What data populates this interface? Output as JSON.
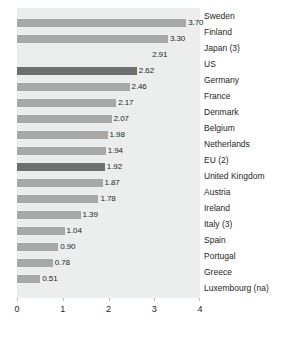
{
  "chart_data": {
    "type": "bar",
    "orientation": "horizontal",
    "title": "",
    "subtitle": "",
    "xlabel": "",
    "ylabel": "",
    "xlim": [
      0,
      4
    ],
    "xticks": [
      "0",
      "1",
      "2",
      "3",
      "4"
    ],
    "grid": false,
    "legend": "none",
    "categories": [
      "Sweden",
      "Finland",
      "Japan (3)",
      "US",
      "Germany",
      "France",
      "Denmark",
      "Belgium",
      "Netherlands",
      "EU (2)",
      "United Kingdom",
      "Austria",
      "Ireland",
      "Italy (3)",
      "Spain",
      "Portugal",
      "Greece",
      "Luxembourg (na)"
    ],
    "values": [
      3.7,
      3.3,
      2.91,
      2.62,
      2.46,
      2.17,
      2.07,
      1.98,
      1.94,
      1.92,
      1.87,
      1.78,
      1.39,
      1.04,
      0.9,
      0.78,
      0.51,
      null
    ],
    "value_labels": [
      "3.70",
      "3.30",
      "2.91",
      "2.62",
      "2.46",
      "2.17",
      "2.07",
      "1.98",
      "1.94",
      "1.92",
      "1.87",
      "1.78",
      "1.39",
      "1.04",
      "0.90",
      "0.78",
      "0.51",
      ""
    ],
    "bar_drawn": [
      true,
      true,
      false,
      true,
      true,
      true,
      true,
      true,
      true,
      true,
      true,
      true,
      true,
      true,
      true,
      true,
      true,
      false
    ],
    "highlighted": [
      false,
      false,
      false,
      true,
      false,
      false,
      false,
      false,
      false,
      true,
      false,
      false,
      false,
      false,
      false,
      false,
      false,
      false
    ],
    "colors": {
      "bar": "#a7a9a8",
      "bar_highlight": "#6e6f6f",
      "plot_background": "#eceded",
      "text": "#231f20",
      "page_background": "#ffffff"
    }
  }
}
